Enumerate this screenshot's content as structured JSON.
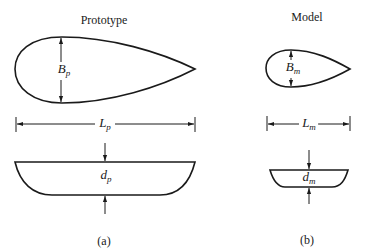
{
  "figure": {
    "prototype": {
      "title": "Prototype",
      "caption": "(a)",
      "beam_label": {
        "base": "B",
        "sub": "p"
      },
      "length_label": {
        "base": "L",
        "sub": "p"
      },
      "draft_label": {
        "base": "d",
        "sub": "p"
      }
    },
    "model": {
      "title": "Model",
      "caption": "(b)",
      "beam_label": {
        "base": "B",
        "sub": "m"
      },
      "length_label": {
        "base": "L",
        "sub": "m"
      },
      "draft_label": {
        "base": "d",
        "sub": "m"
      }
    },
    "colors": {
      "stroke": "#1a1a1a",
      "background": "#ffffff"
    }
  }
}
